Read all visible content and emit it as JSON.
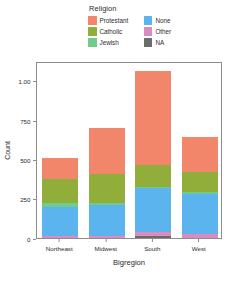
{
  "chart_data": {
    "type": "bar",
    "stacked": true,
    "title": "",
    "xlabel": "Bigregion",
    "ylabel": "Count",
    "categories": [
      "Northeast",
      "Midwest",
      "South",
      "West"
    ],
    "ylim": [
      0,
      1125
    ],
    "yticks": [
      0,
      250,
      500,
      750,
      1000
    ],
    "ytick_labels": [
      "0",
      "250",
      "500",
      "750",
      "1.00"
    ],
    "grid": false,
    "legend_title": "Religion",
    "legend_position": "top",
    "stack_order_bottom_to_top": [
      "NA",
      "Other",
      "None",
      "Jewish",
      "Catholic",
      "Protestant"
    ],
    "series": [
      {
        "name": "Protestant",
        "color": "#F2866B",
        "values": [
          135,
          290,
          600,
          225
        ]
      },
      {
        "name": "Catholic",
        "color": "#92AE3A",
        "values": [
          155,
          190,
          135,
          130
        ]
      },
      {
        "name": "Jewish",
        "color": "#6FCB8E",
        "values": [
          25,
          10,
          10,
          10
        ]
      },
      {
        "name": "None",
        "color": "#5BB4ED",
        "values": [
          180,
          200,
          280,
          255
        ]
      },
      {
        "name": "Other",
        "color": "#D98CC0",
        "values": [
          15,
          10,
          25,
          25
        ]
      },
      {
        "name": "NA",
        "color": "#6B6B6B",
        "values": [
          0,
          0,
          12,
          0
        ]
      }
    ],
    "totals": [
      510,
      700,
      1062,
      645
    ]
  },
  "legend": {
    "title": "Religion",
    "left_column": [
      {
        "label": "Protestant",
        "color": "#F2866B"
      },
      {
        "label": "Catholic",
        "color": "#92AE3A"
      },
      {
        "label": "Jewish",
        "color": "#6FCB8E"
      }
    ],
    "right_column": [
      {
        "label": "None",
        "color": "#5BB4ED"
      },
      {
        "label": "Other",
        "color": "#D98CC0"
      },
      {
        "label": "NA",
        "color": "#6B6B6B"
      }
    ]
  },
  "axes": {
    "y_title": "Count",
    "x_title": "Bigregion"
  }
}
